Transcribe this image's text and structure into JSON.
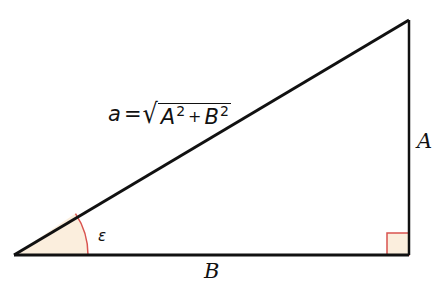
{
  "diagram": {
    "type": "right-triangle",
    "vertices": {
      "left": [
        14,
        255
      ],
      "right_bottom": [
        409,
        255
      ],
      "top": [
        409,
        20
      ]
    },
    "colors": {
      "stroke": "#111111",
      "fill_highlight": "#fbeedd",
      "marker_stroke": "#d9534f"
    },
    "labels": {
      "hypotenuse_var": "a",
      "equals": "=",
      "radical": "√",
      "term1": "A",
      "term1_exp": "2",
      "plus": "+",
      "term2": "B",
      "term2_exp": "2",
      "vertical_side": "A",
      "horizontal_side": "B",
      "angle": "ε"
    },
    "right_angle_marker": {
      "x": 387,
      "y": 233,
      "size": 22
    },
    "angle_arc": {
      "center": [
        14,
        255
      ],
      "radius": 74
    }
  }
}
